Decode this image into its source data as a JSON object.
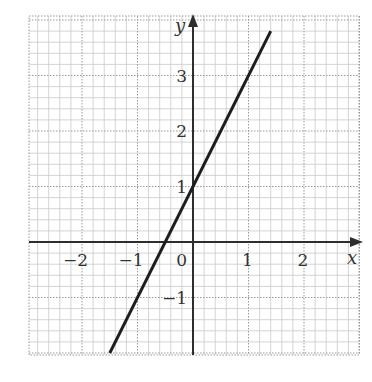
{
  "chart_data": {
    "type": "line",
    "title": "",
    "xlabel": "x",
    "ylabel": "y",
    "xlim": [
      -3,
      3
    ],
    "ylim": [
      -2.05,
      4.1
    ],
    "grid": true,
    "grid_minor_step": 0.2,
    "grid_major_step": 1,
    "x_ticks": [
      -2,
      -1,
      0,
      1,
      2
    ],
    "x_tick_labels": [
      "−2",
      "−1",
      "0",
      "1",
      "2"
    ],
    "y_ticks": [
      -1,
      1,
      2,
      3
    ],
    "y_tick_labels": [
      "−1",
      "1",
      "2",
      "3"
    ],
    "origin_label": "0",
    "series": [
      {
        "name": "y = 2x + 1",
        "equation": "y = 2x + 1",
        "slope": 2,
        "intercept": 1,
        "x": [
          -1.5,
          1.4
        ],
        "y": [
          -2,
          3.8
        ]
      }
    ],
    "legend": null
  },
  "style": {
    "line_color": "#1e1e1e",
    "axis_color": "#2e2e2e",
    "grid_minor_color": "#c9c9c9",
    "grid_major_color": "#9a9a9a",
    "background": "#ffffff"
  },
  "layout": {
    "origin_px": [
      193,
      242
    ],
    "unit_px": 55.5,
    "grid_left": 29,
    "grid_top": 16,
    "grid_right": 359,
    "grid_bottom": 355
  }
}
